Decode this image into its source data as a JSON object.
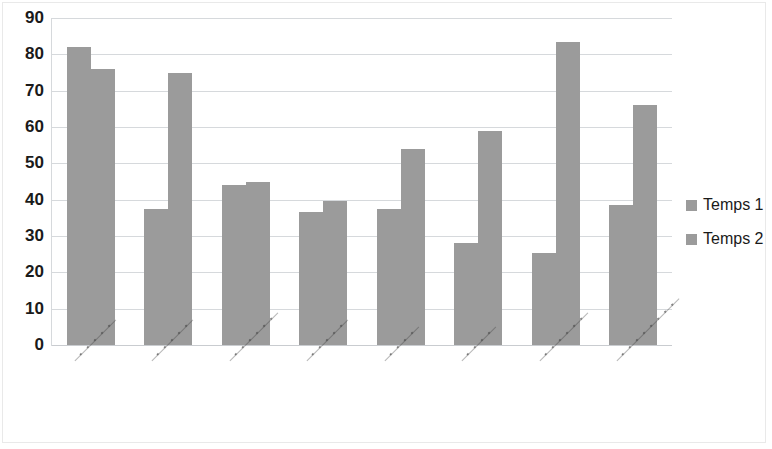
{
  "chart_data": {
    "type": "bar",
    "title": "",
    "subtitle": "",
    "xlabel": "",
    "ylabel": "",
    "ylim": [
      0,
      90
    ],
    "y_ticks": [
      0,
      10,
      20,
      30,
      40,
      50,
      60,
      70,
      80,
      90
    ],
    "y_tick_labels": [
      "0",
      "10",
      "20",
      "30",
      "40",
      "50",
      "60",
      "70",
      "80",
      "90"
    ],
    "grid": true,
    "grid_axis": "y",
    "legend_position": "right",
    "bar_color": "#9b9b9b",
    "categories": [
      "(illegible)",
      "(illegible)",
      "(illegible)",
      "(illegible)",
      "(illegible)",
      "(illegible)",
      "(illegible)",
      "(illegible)"
    ],
    "category_labels_legible": false,
    "series": [
      {
        "name": "Temps 1",
        "color": "#9b9b9b",
        "values": [
          82,
          37.5,
          44,
          36.5,
          37.5,
          28,
          25.3,
          38.5
        ]
      },
      {
        "name": "Temps 2",
        "color": "#9b9b9b",
        "values": [
          76,
          75,
          45,
          39.5,
          54,
          59,
          83.5,
          66
        ]
      }
    ]
  },
  "legend": {
    "items": [
      {
        "label": "Temps 1"
      },
      {
        "label": "Temps 2"
      }
    ]
  }
}
